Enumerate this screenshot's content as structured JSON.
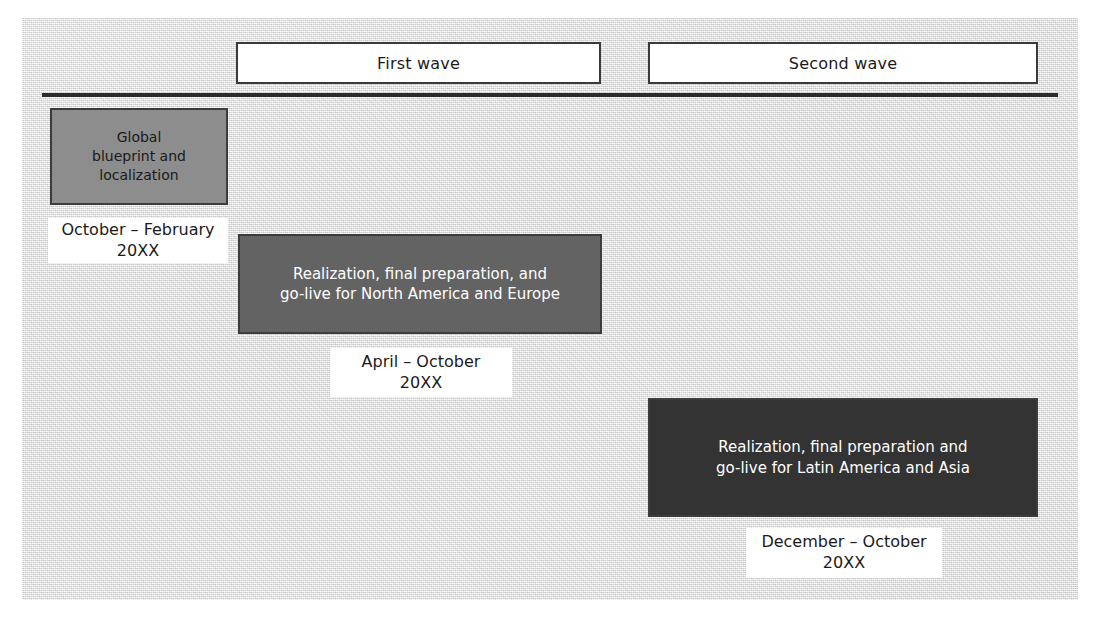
{
  "figure": {
    "waves": [
      {
        "id": "first",
        "label": "First wave"
      },
      {
        "id": "second",
        "label": "Second wave"
      }
    ],
    "phases": [
      {
        "id": "blueprint",
        "text": "Global\nblueprint and\nlocalization",
        "date": "October – February\n20XX",
        "wave": "First wave",
        "fill": "#8d8d8d",
        "text_color": "#1a1a1a"
      },
      {
        "id": "realization-na-eu",
        "text": "Realization, final preparation, and\ngo-live for North America and Europe",
        "date": "April – October\n20XX",
        "wave": "First wave",
        "fill": "#636363",
        "text_color": "#ffffff"
      },
      {
        "id": "realization-latam-asia",
        "text": "Realization, final preparation and\ngo-live for Latin America and Asia",
        "date": "December – October\n20XX",
        "wave": "Second wave",
        "fill": "#333333",
        "text_color": "#ffffff"
      }
    ],
    "axis": {
      "color": "#2b2b2b"
    },
    "colors": {
      "background": "#e3e3e3",
      "box_border": "#3c3c3c",
      "label_background": "#ffffff"
    }
  }
}
